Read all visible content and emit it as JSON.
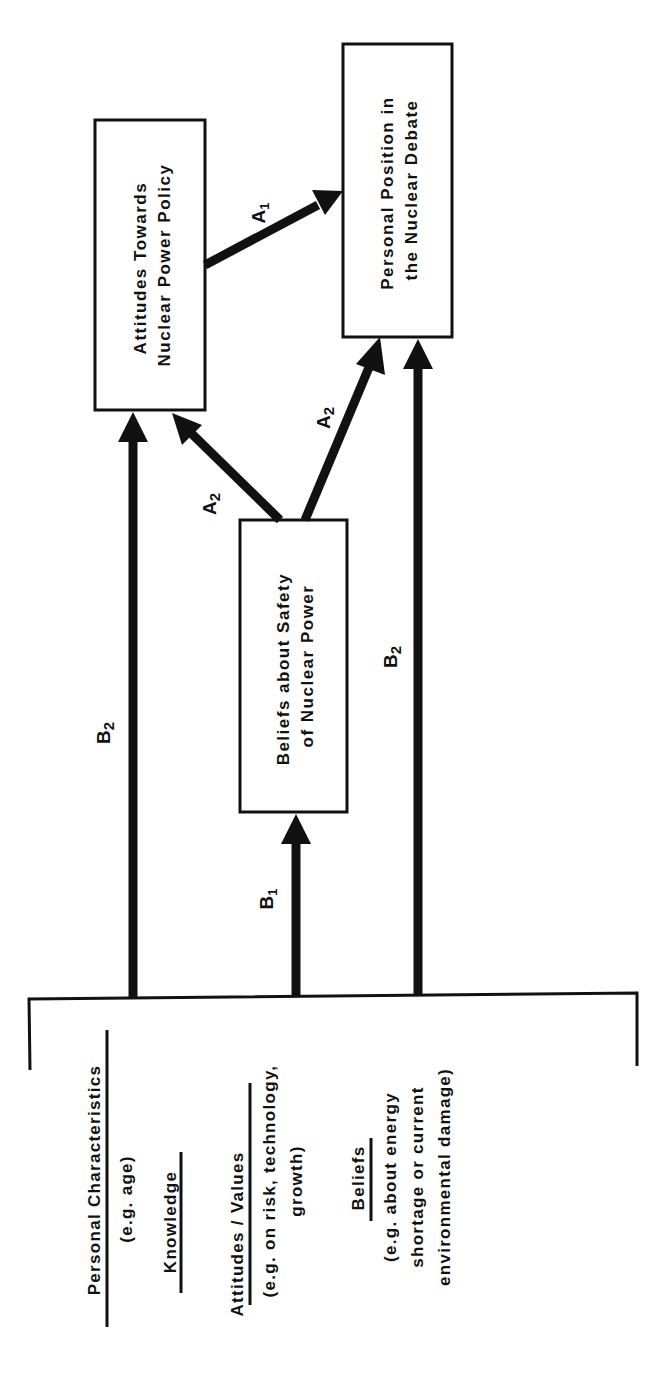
{
  "diagram": {
    "orientation": "rotated-90-ccw",
    "nodes": {
      "attitudes_policy": {
        "line1": "Attitudes Towards",
        "line2": "Nuclear Power Policy"
      },
      "personal_position": {
        "line1": "Personal Position in",
        "line2": "the Nuclear Debate"
      },
      "beliefs_safety": {
        "line1": "Beliefs about Safety",
        "line2": "of Nuclear Power"
      }
    },
    "edges": [
      {
        "from": "attitudes_policy",
        "to": "personal_position",
        "label": "A",
        "sub": "1"
      },
      {
        "from": "beliefs_safety",
        "to": "attitudes_policy",
        "label": "A",
        "sub": "2"
      },
      {
        "from": "beliefs_safety",
        "to": "personal_position",
        "label": "A",
        "sub": "2"
      },
      {
        "from": "predictors",
        "to": "attitudes_policy",
        "label": "B",
        "sub": "2"
      },
      {
        "from": "predictors",
        "to": "beliefs_safety",
        "label": "B",
        "sub": "1"
      },
      {
        "from": "predictors",
        "to": "personal_position",
        "label": "B",
        "sub": "2"
      }
    ],
    "edge_labels": {
      "a1": {
        "main": "A",
        "sub": "1"
      },
      "a2_left": {
        "main": "A",
        "sub": "2"
      },
      "a2_right": {
        "main": "A",
        "sub": "2"
      },
      "b2_left": {
        "main": "B",
        "sub": "2"
      },
      "b1": {
        "main": "B",
        "sub": "1"
      },
      "b2_right": {
        "main": "B",
        "sub": "2"
      }
    },
    "predictors": {
      "personal": {
        "title": "Personal Characteristics",
        "detail": "(e.g. age)"
      },
      "knowledge": {
        "title": "Knowledge"
      },
      "attitudes_values": {
        "title": "Attitudes / Values",
        "detail1": "(e.g. on risk, technology,",
        "detail2": "growth)"
      },
      "beliefs": {
        "title": "Beliefs",
        "detail1": "(e.g. about energy",
        "detail2": "shortage or current",
        "detail3": "environmental damage)"
      }
    }
  }
}
